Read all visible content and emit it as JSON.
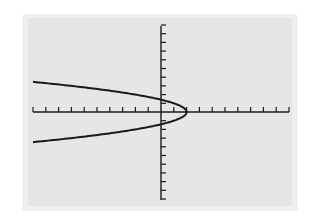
{
  "chart_data": {
    "type": "line",
    "title": "",
    "xlabel": "",
    "ylabel": "",
    "equation": "x = 2 - y^2",
    "xlim": [
      -10,
      10
    ],
    "ylim": [
      -10,
      10
    ],
    "xscale": 1,
    "yscale": 1,
    "grid": false,
    "legend": "none",
    "series": [
      {
        "name": "x = 2 - y^2",
        "points": [
          [
            -10,
            3.46
          ],
          [
            -7,
            3
          ],
          [
            -4,
            2.45
          ],
          [
            -2,
            2
          ],
          [
            0,
            1.41
          ],
          [
            1,
            1
          ],
          [
            1.75,
            0.5
          ],
          [
            2,
            0
          ],
          [
            1.75,
            -0.5
          ],
          [
            1,
            -1
          ],
          [
            0,
            -1.41
          ],
          [
            -2,
            -2
          ],
          [
            -4,
            -2.45
          ],
          [
            -7,
            -3
          ],
          [
            -10,
            -3.46
          ]
        ]
      }
    ],
    "vertex": [
      2,
      0
    ],
    "y_intercepts": [
      1.41,
      -1.41
    ],
    "colors": {
      "curve": "#1a1a1a",
      "axes": "#1a1a1a",
      "screen": "#e6e6e6",
      "bezel": "#efefef"
    }
  }
}
